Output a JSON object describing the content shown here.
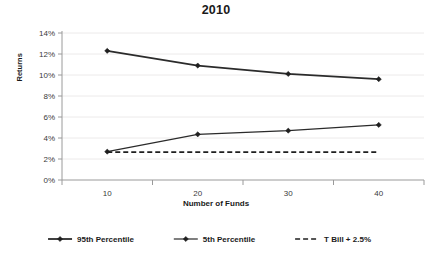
{
  "chart_data": {
    "type": "line",
    "title": "2010",
    "xlabel": "Number of Funds",
    "ylabel": "Returns",
    "categories": [
      "10",
      "20",
      "30",
      "40"
    ],
    "x": [
      10,
      20,
      30,
      40
    ],
    "ylim": [
      0,
      14
    ],
    "ytick_labels": [
      "0%",
      "2%",
      "4%",
      "6%",
      "8%",
      "10%",
      "12%",
      "14%"
    ],
    "ytick_values": [
      0,
      2,
      4,
      6,
      8,
      10,
      12,
      14
    ],
    "grid": true,
    "legend_position": "bottom",
    "series": [
      {
        "name": "95th Percentile",
        "values": [
          12.3,
          10.9,
          10.1,
          9.6
        ],
        "style": "solid-thick",
        "marker": "diamond",
        "color": "#2b2b2b"
      },
      {
        "name": "5th Percentile",
        "values": [
          2.7,
          4.35,
          4.7,
          5.25
        ],
        "style": "solid-thin",
        "marker": "diamond",
        "color": "#2b2b2b"
      },
      {
        "name": "T Bill + 2.5%",
        "values": [
          2.65,
          2.65,
          2.65,
          2.65
        ],
        "style": "dashed",
        "marker": "none",
        "color": "#1f1f1f"
      }
    ]
  },
  "legend": {
    "items": [
      {
        "label": "95th Percentile",
        "style": "solid-thick"
      },
      {
        "label": "5th Percentile",
        "style": "solid-thin"
      },
      {
        "label": "T Bill + 2.5%",
        "style": "dashed"
      }
    ]
  }
}
